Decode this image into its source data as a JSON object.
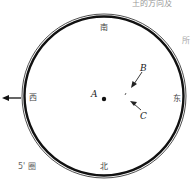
{
  "diagram": {
    "top_text_fragment": "土的方向及",
    "side_text_fragment": "所",
    "directions": {
      "top": "南",
      "bottom": "北",
      "left": "西",
      "right": "东"
    },
    "points": {
      "center": "A",
      "arrow_b": "B",
      "arrow_c": "C"
    },
    "caption": "5' 圈"
  }
}
